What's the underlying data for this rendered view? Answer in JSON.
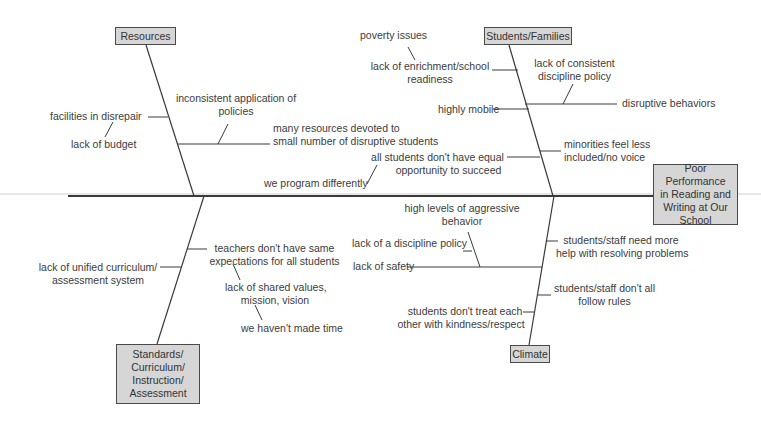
{
  "diagram": {
    "type": "fishbone",
    "effect": "Poor Performance in Reading and Writing at Our School",
    "effect_lines": [
      "Poor Performance",
      "in Reading and",
      "Writing at Our",
      "School"
    ],
    "colors": {
      "box_fill": "#d6d6d6",
      "box_border": "#4a4a4a",
      "line": "#3a3a3a",
      "text": "#3c3c3c"
    },
    "categories": [
      {
        "name": "Resources",
        "causes": [
          {
            "text": "facilities in disrepair",
            "sub": [
              "lack of budget"
            ]
          },
          {
            "text": "inconsistent application of policies"
          },
          {
            "text": "many resources devoted to small number of disruptive students"
          }
        ]
      },
      {
        "name": "Students/Families",
        "causes": [
          {
            "text": "lack of enrichment/school readiness",
            "sub": [
              "poverty issues"
            ]
          },
          {
            "text": "highly mobile"
          },
          {
            "text": "disruptive behaviors",
            "sub": [
              "lack of consistent discipline policy"
            ]
          },
          {
            "text": "all students don't have equal opportunity to succeed",
            "sub": [
              "we program differently"
            ]
          },
          {
            "text": "minorities feel less included/no voice"
          }
        ]
      },
      {
        "name": "Standards/Curriculum/Instruction/Assessment",
        "name_lines": [
          "Standards/",
          "Curriculum/",
          "Instruction/",
          "Assessment"
        ],
        "causes": [
          {
            "text": "lack of unified curriculum/ assessment system"
          },
          {
            "text": "teachers don't have same expectations for all students",
            "sub": [
              "lack of shared values, mission, vision",
              "we haven't made time"
            ]
          }
        ]
      },
      {
        "name": "Climate",
        "causes": [
          {
            "text": "lack of safety",
            "sub": [
              "high levels of aggressive behavior",
              "lack of a discipline policy"
            ]
          },
          {
            "text": "students/staff need more help with resolving problems"
          },
          {
            "text": "students/staff don't all follow rules"
          },
          {
            "text": "students don't treat each other with kindness/respect"
          }
        ]
      }
    ]
  },
  "labels": {
    "resources": "Resources",
    "students_families": "Students/Families",
    "climate": "Climate",
    "std1": "Standards/",
    "std2": "Curriculum/",
    "std3": "Instruction/",
    "std4": "Assessment",
    "eff1": "Poor Performance",
    "eff2": "in Reading and",
    "eff3": "Writing at Our",
    "eff4": "School",
    "facilities1": "facilities in disrepair",
    "budget": "lack of budget",
    "inconsistent1": "inconsistent application of",
    "inconsistent2": "policies",
    "many1": "many resources devoted to",
    "many2": "small number of disruptive students",
    "poverty": "poverty issues",
    "enrich1": "lack of enrichment/school",
    "enrich2": "readiness",
    "mobile": "highly mobile",
    "consistent1": "lack of consistent",
    "consistent2": "discipline policy",
    "disruptive": "disruptive behaviors",
    "equal1": "all students don't have equal",
    "equal2": "opportunity to succeed",
    "program": "we program differently",
    "minor1": "minorities feel less",
    "minor2": "included/no voice",
    "unified1": "lack of unified curriculum/",
    "unified2": "assessment system",
    "teachers1": "teachers don't have same",
    "teachers2": "expectations for all students",
    "shared1": "lack of shared values,",
    "shared2": "mission, vision",
    "time": "we haven't made time",
    "aggr1": "high levels of aggressive",
    "aggr2": "behavior",
    "discpol": "lack of a discipline policy",
    "safety": "lack of safety",
    "help1": "students/staff need more",
    "help2": "help with resolving problems",
    "rules1": "students/staff don't all",
    "rules2": "follow rules",
    "kind1": "students don't treat each",
    "kind2": "other with kindness/respect"
  }
}
